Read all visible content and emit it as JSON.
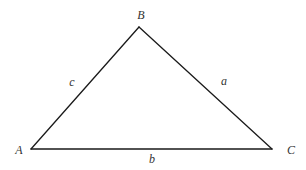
{
  "diagram": {
    "type": "triangle",
    "vertices": {
      "A": {
        "label": "A",
        "x": 31,
        "y": 149
      },
      "B": {
        "label": "B",
        "x": 139,
        "y": 27
      },
      "C": {
        "label": "C",
        "x": 272,
        "y": 149
      }
    },
    "sides": {
      "a": {
        "label": "a",
        "from": "B",
        "to": "C"
      },
      "b": {
        "label": "b",
        "from": "A",
        "to": "C"
      },
      "c": {
        "label": "c",
        "from": "A",
        "to": "B"
      }
    },
    "colors": {
      "stroke": "#1a1a1a",
      "label": "#333333",
      "background": "#ffffff"
    }
  }
}
